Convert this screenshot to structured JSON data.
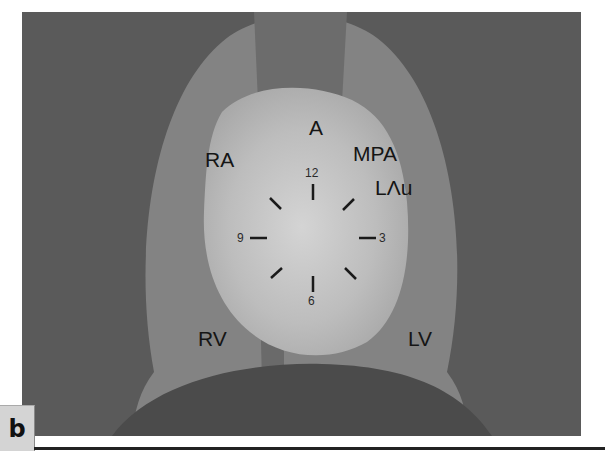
{
  "figure": {
    "panel_label": "b",
    "labels": {
      "A": "A",
      "RA": "RA",
      "MPA": "MPA",
      "LAu": "LΛu",
      "RV": "RV",
      "LV": "LV"
    },
    "clock": {
      "n12": "12",
      "n3": "3",
      "n6": "6",
      "n9": "9"
    },
    "colors": {
      "background": "#5a5a5a",
      "lungs": "#838383",
      "mediastinum_band": "#6a6a6a",
      "heart_center": "#d2d2d2",
      "heart_edge": "#a9a9a9",
      "diaphragm": "#4a4a4a",
      "label_text": "#151515"
    }
  }
}
